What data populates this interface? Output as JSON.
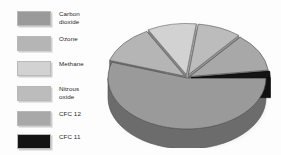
{
  "figure": {
    "background_color": "#fdfdfd",
    "title": ""
  },
  "legend": {
    "position": "left",
    "items": [
      {
        "label": "Carbon\ndioxide",
        "color": "#9a9a9a",
        "swatch_name": "legend-swatch-carbon-dioxide"
      },
      {
        "label": "Ozone",
        "color": "#b5b5b5",
        "swatch_name": "legend-swatch-ozone"
      },
      {
        "label": "Methane",
        "color": "#d2d2d2",
        "swatch_name": "legend-swatch-methane"
      },
      {
        "label": "Nitrous\noxide",
        "color": "#bcbcbc",
        "swatch_name": "legend-swatch-nitrous-oxide"
      },
      {
        "label": "CFC 12",
        "color": "#a8a8a8",
        "swatch_name": "legend-swatch-cfc-12"
      },
      {
        "label": "CFC 11",
        "color": "#141414",
        "swatch_name": "legend-swatch-cfc-11"
      }
    ]
  },
  "chart_data": {
    "type": "pie",
    "title": "",
    "style": "3d",
    "labels": [
      "Carbon dioxide",
      "Ozone",
      "Methane",
      "Nitrous oxide",
      "CFC 12",
      "CFC 11"
    ],
    "values": [
      55,
      12,
      10,
      9,
      12,
      2
    ],
    "units": "percent",
    "colors": [
      "#9a9a9a",
      "#b5b5b5",
      "#d2d2d2",
      "#bcbcbc",
      "#a8a8a8",
      "#141414"
    ],
    "legend_position": "left",
    "grid": false,
    "start_angle_deg": 0,
    "direction": "clockwise",
    "depth_px": 20,
    "center": {
      "x": 83,
      "y": 64
    },
    "radius": {
      "rx": 79,
      "ry": 51
    }
  }
}
